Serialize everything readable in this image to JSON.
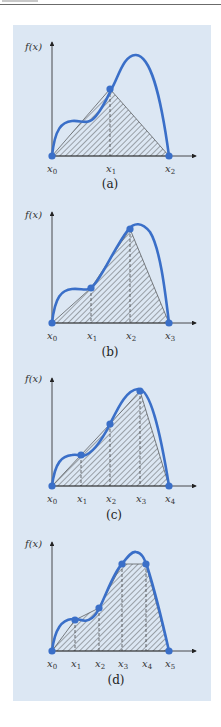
{
  "figure": {
    "ylabel": "f(x)",
    "colors": {
      "curve": "#3a6fc8",
      "background": "#dce7f3",
      "axis": "#222222",
      "hatch": "#333333"
    },
    "panels": [
      {
        "caption": "(a)",
        "labels": [
          "x0",
          "x1",
          "x2"
        ]
      },
      {
        "caption": "(b)",
        "labels": [
          "x0",
          "x1",
          "x2",
          "x3"
        ]
      },
      {
        "caption": "(c)",
        "labels": [
          "x0",
          "x1",
          "x2",
          "x3",
          "x4"
        ]
      },
      {
        "caption": "(d)",
        "labels": [
          "x0",
          "x1",
          "x2",
          "x3",
          "x4",
          "x5"
        ]
      }
    ]
  },
  "text": {
    "fx": "f(x)",
    "x": "x",
    "cap_a": "(a)",
    "cap_b": "(b)",
    "cap_c": "(c)",
    "cap_d": "(d)",
    "s0": "0",
    "s1": "1",
    "s2": "2",
    "s3": "3",
    "s4": "4",
    "s5": "5"
  }
}
